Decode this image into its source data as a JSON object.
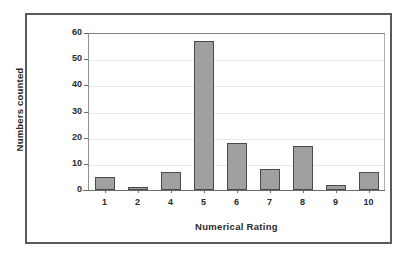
{
  "chart_data": {
    "type": "bar",
    "title": "",
    "xlabel": "Numerical Rating",
    "ylabel": "Numbers counted",
    "categories": [
      "1",
      "2",
      "4",
      "5",
      "6",
      "7",
      "8",
      "9",
      "10"
    ],
    "values": [
      5,
      1,
      7,
      57,
      18,
      8,
      17,
      2,
      7
    ],
    "ylim": [
      0,
      60
    ],
    "yticks": [
      0,
      10,
      20,
      30,
      40,
      50,
      60
    ],
    "ytick_labels": [
      "0",
      "10",
      "20",
      "30",
      "40",
      "50",
      "60"
    ],
    "grid": true,
    "legend": null,
    "series": [
      {
        "name": "Numbers counted",
        "values": [
          5,
          1,
          7,
          57,
          18,
          8,
          17,
          2,
          7
        ],
        "color": "#a0a0a0",
        "edge_color": "#4a4a4a"
      }
    ]
  },
  "figure": {
    "background_color": "#ffffff",
    "frame_color": "#5a5a5a",
    "gridline_color": "#e8e8e8",
    "axis_color": "#6b6b6b",
    "text_color": "#2a2a2a"
  }
}
